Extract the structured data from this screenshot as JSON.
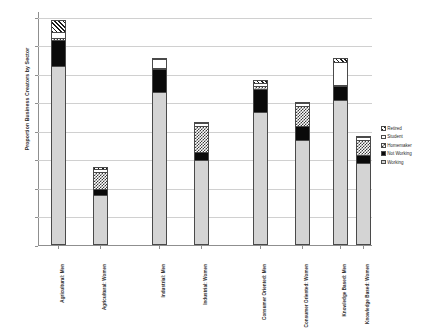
{
  "chart_data": {
    "type": "bar",
    "stacked": true,
    "title": "",
    "xlabel": "",
    "ylabel": "Proportion Business Creators by Sector",
    "ylim": [
      0,
      80
    ],
    "ytick_labels": [
      "0%",
      "10%",
      "20%",
      "30%",
      "40%",
      "50%",
      "60%",
      "70%",
      "80%"
    ],
    "ytick_values": [
      0,
      10,
      20,
      30,
      40,
      50,
      60,
      70,
      80
    ],
    "grid": true,
    "legend_position": "right",
    "categories": [
      "Agricultural: Men",
      "Agricultural: Women",
      "Industrial: Men",
      "Industrial: Women",
      "Consumer Oriented: Men",
      "Consumer Oriented: Women",
      "Knowledge Based: Men",
      "Knowledge Based: Women"
    ],
    "series": [
      {
        "name": "Working",
        "values": [
          62,
          17,
          53,
          29,
          46,
          36,
          50,
          28
        ]
      },
      {
        "name": "Not Working",
        "values": [
          9,
          2,
          8,
          3,
          8,
          5,
          5,
          3
        ]
      },
      {
        "name": "Homemaker",
        "values": [
          1,
          6,
          0.5,
          9,
          1,
          7,
          0.5,
          5
        ]
      },
      {
        "name": "Student",
        "values": [
          2,
          1,
          3,
          1,
          1,
          1,
          8,
          1
        ]
      },
      {
        "name": "Retired",
        "values": [
          4,
          0.5,
          0.5,
          0.5,
          1,
          0.5,
          1.5,
          0.5
        ]
      }
    ],
    "legend_order_top_to_bottom": [
      "Retired",
      "Student",
      "Homemaker",
      "Not Working",
      "Working"
    ]
  },
  "legend": {
    "items": [
      {
        "label": "Retired",
        "pattern": "diagonal-hatch"
      },
      {
        "label": "Student",
        "pattern": "solid-white"
      },
      {
        "label": "Homemaker",
        "pattern": "checkerboard"
      },
      {
        "label": "Not Working",
        "pattern": "solid-black"
      },
      {
        "label": "Working",
        "pattern": "solid-light-gray"
      }
    ]
  },
  "colors": {
    "working": "#d4d4d4",
    "not_working": "#0a0a0a",
    "student": "#ffffff",
    "axis": "#8f8f8f",
    "gridline": "#d0d0d0",
    "text": "#2b2b2b"
  }
}
